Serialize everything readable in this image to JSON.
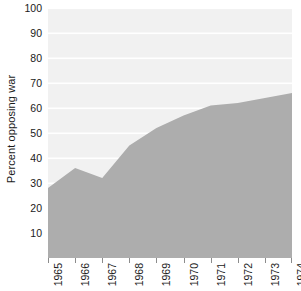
{
  "chart_data": {
    "type": "area",
    "title": "",
    "xlabel": "",
    "ylabel": "Percent opposing war",
    "categories": [
      "1965",
      "1966",
      "1967",
      "1968",
      "1969",
      "1970",
      "1971",
      "1972",
      "1973",
      "1974"
    ],
    "values": [
      28,
      36,
      32,
      45,
      52,
      57,
      61,
      62,
      64,
      66
    ],
    "series": [
      {
        "name": "Percent opposing war",
        "values": [
          28,
          36,
          32,
          45,
          52,
          57,
          61,
          62,
          64,
          66
        ]
      }
    ],
    "ylim": [
      0,
      100
    ],
    "yticks": [
      10,
      20,
      30,
      40,
      50,
      60,
      70,
      80,
      90,
      100
    ],
    "ytick_labels": [
      "10",
      "20",
      "30",
      "40",
      "50",
      "60",
      "70",
      "80",
      "90",
      "100"
    ],
    "xtick_labels": [
      "1965",
      "1966",
      "1967",
      "1968",
      "1969",
      "1970",
      "1971",
      "1972",
      "1973",
      "1974"
    ],
    "grid": "horizontal-white-gridlines",
    "legend": "none",
    "colors": {
      "area_fill": "#adadad",
      "plot_background": "#f1f1f1",
      "gridline": "#ffffff",
      "text": "#1a1a1a",
      "tick_mark": "#8c8c8c",
      "figure_background": "#ffffff"
    }
  }
}
